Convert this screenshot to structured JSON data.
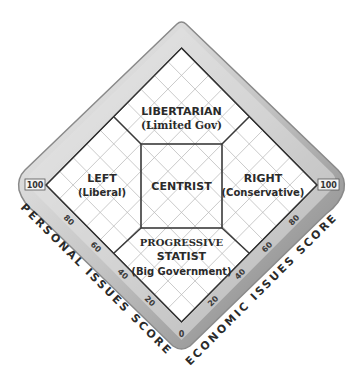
{
  "diagram": {
    "type": "nolan_chart",
    "regions": {
      "libertarian": {
        "title": "LIBERTARIAN",
        "subtitle": "(Limited Gov)"
      },
      "left": {
        "title": "LEFT",
        "subtitle": "(Liberal)"
      },
      "centrist": {
        "title": "CENTRIST"
      },
      "right": {
        "title": "RIGHT",
        "subtitle": "(Conservative)"
      },
      "statist": {
        "title": "PROGRESSIVE",
        "title2": "STATIST",
        "subtitle": "(Big Government)"
      }
    },
    "axes": {
      "personal": {
        "label": "PERSONAL ISSUES SCORE",
        "max_label": "100",
        "ticks": [
          "80",
          "60",
          "40",
          "20"
        ]
      },
      "economic": {
        "label": "ECONOMIC ISSUES SCORE",
        "max_label": "100",
        "ticks": [
          "20",
          "40",
          "60",
          "80"
        ]
      },
      "origin": "0"
    },
    "colors": {
      "grid": "#b8b8b8",
      "border": "#3a3a3a",
      "band_light": "#e6e6e6",
      "band_dark": "#9a9a9a"
    }
  }
}
